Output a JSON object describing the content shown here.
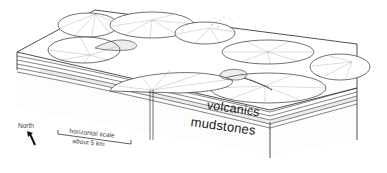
{
  "diagram": {
    "labels": {
      "volcanics": "volcanics",
      "mudstones": "mudstones",
      "north": "North",
      "scale_line1": "horizontal scale",
      "scale_line2": "about 5 km"
    },
    "features": [
      {
        "name": "volcanic-cone",
        "count": 7
      },
      {
        "name": "lava-flow",
        "count": 2
      },
      {
        "name": "eruption-plume",
        "count": 1
      },
      {
        "name": "feeder-dyke",
        "count": 1
      }
    ],
    "layers": [
      "volcanics",
      "mudstones"
    ],
    "colors": {
      "ink": "#222222",
      "hatch": "#888888",
      "background": "#ffffff"
    }
  }
}
